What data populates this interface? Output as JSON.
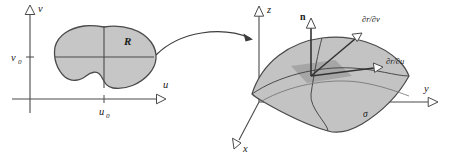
{
  "figure": {
    "background_color": "#ffffff",
    "line_color": "#4a4a4a",
    "region_fill_color": "#c6c6c6",
    "surface_fill_color": "#c3c3c3",
    "patch_fill_color": "#a6a6a6"
  },
  "left_panel": {
    "name": "uv-parameter-plane",
    "axes": {
      "vertical_label": "v",
      "horizontal_label": "u"
    },
    "ticks": {
      "v_tick_label": "v",
      "v_tick_sub": "0",
      "u_tick_label": "u",
      "u_tick_sub": "0"
    },
    "region": {
      "label": "R",
      "description": "shaded bean-shaped region in the uv-plane"
    }
  },
  "mapping_arrow": {
    "name": "mapping-arrow",
    "description": "curved arrow from region R to the surface"
  },
  "right_panel": {
    "name": "xyz-surface",
    "axes": {
      "z_label": "z",
      "y_label": "y",
      "x_label": "x"
    },
    "normal_vector": {
      "label": "n",
      "description": "unit normal vector to the surface"
    },
    "tangent_vectors": [
      {
        "label": "∂r/∂v",
        "name": "partial-r-partial-v"
      },
      {
        "label": "∂r/∂u",
        "name": "partial-r-partial-u"
      }
    ],
    "surface": {
      "label": "σ",
      "description": "curved parametric surface patch with grid curves"
    }
  }
}
